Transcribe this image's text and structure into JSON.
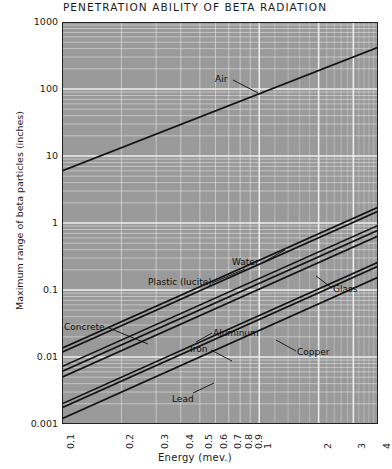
{
  "chart_data": {
    "type": "line",
    "title": "PENETRATION ABILITY OF BETA RADIATION",
    "xlabel": "Energy (mev.)",
    "ylabel": "Maximum range of beta particles (inches)",
    "xscale": "log",
    "yscale": "log",
    "xlim": [
      0.1,
      4
    ],
    "ylim": [
      0.001,
      1000
    ],
    "grid": true,
    "legend": "inline-annotations",
    "xticks": [
      "0.1",
      "0.2",
      "0.3",
      "0.4",
      "0.5",
      "0.6",
      "0.7",
      "0.8",
      "0.9",
      "1",
      "2",
      "3",
      "4"
    ],
    "xtick_values": [
      0.1,
      0.2,
      0.3,
      0.4,
      0.5,
      0.6,
      0.7,
      0.8,
      0.9,
      1,
      2,
      3,
      4
    ],
    "yticks": [
      "1000",
      "100",
      "10",
      "1",
      "0.1",
      "0.01",
      "0.001"
    ],
    "ytick_values": [
      1000,
      100,
      10,
      1,
      0.1,
      0.01,
      0.001
    ],
    "series": [
      {
        "name": "Air",
        "label": "Air",
        "x": [
          0.1,
          4
        ],
        "y": [
          6.0,
          420.0
        ]
      },
      {
        "name": "Water",
        "label": "Water",
        "x": [
          0.1,
          4
        ],
        "y": [
          0.0135,
          1.72
        ]
      },
      {
        "name": "Plastic (lucite)",
        "label": "Plastic (lucite)",
        "x": [
          0.1,
          4
        ],
        "y": [
          0.0118,
          1.5
        ]
      },
      {
        "name": "Glass",
        "label": "Glass",
        "x": [
          0.1,
          4
        ],
        "y": [
          0.0072,
          0.92
        ]
      },
      {
        "name": "Concrete",
        "label": "Concrete",
        "x": [
          0.1,
          4
        ],
        "y": [
          0.0061,
          0.78
        ]
      },
      {
        "name": "Aluminum",
        "label": "Aluminum",
        "x": [
          0.1,
          4
        ],
        "y": [
          0.005,
          0.64
        ]
      },
      {
        "name": "Iron",
        "label": "Iron",
        "x": [
          0.1,
          4
        ],
        "y": [
          0.002,
          0.26
        ]
      },
      {
        "name": "Copper",
        "label": "Copper",
        "x": [
          0.1,
          4
        ],
        "y": [
          0.00175,
          0.225
        ]
      },
      {
        "name": "Lead",
        "label": "Lead",
        "x": [
          0.1,
          4
        ],
        "y": [
          0.0012,
          0.155
        ]
      }
    ],
    "annotations": [
      {
        "text": "Air",
        "x": 215,
        "y": 75,
        "lx1": 233,
        "ly1": 80,
        "lx2": 258,
        "ly2": 93
      },
      {
        "text": "Water",
        "x": 232,
        "y": 258,
        "lx1": 262,
        "ly1": 263,
        "lx2": 285,
        "ly2": 250
      },
      {
        "text": "Plastic (lucite)",
        "x": 148,
        "y": 278,
        "lx1": 212,
        "ly1": 283,
        "lx2": 245,
        "ly2": 269
      },
      {
        "text": "Glass",
        "x": 333,
        "y": 285,
        "lx1": 332,
        "ly1": 288,
        "lx2": 316,
        "ly2": 276
      },
      {
        "text": "Concrete",
        "x": 64,
        "y": 323,
        "lx1": 109,
        "ly1": 328,
        "lx2": 148,
        "ly2": 344
      },
      {
        "text": "Aluminum",
        "x": 213,
        "y": 329,
        "lx1": 212,
        "ly1": 333,
        "lx2": 196,
        "ly2": 342
      },
      {
        "text": "Iron",
        "x": 190,
        "y": 345,
        "lx1": 211,
        "ly1": 350,
        "lx2": 232,
        "ly2": 361
      },
      {
        "text": "Copper",
        "x": 297,
        "y": 348,
        "lx1": 296,
        "ly1": 351,
        "lx2": 276,
        "ly2": 340
      },
      {
        "text": "Lead",
        "x": 172,
        "y": 395,
        "lx1": 193,
        "ly1": 393,
        "lx2": 214,
        "ly2": 383
      }
    ],
    "colors": {
      "plot_background": "#9a9a9a",
      "gridline": "#f2f2f2",
      "series_line": "#141414",
      "frame": "#222222",
      "page_background": "#ffffff",
      "text": "#1a1a1a"
    }
  }
}
